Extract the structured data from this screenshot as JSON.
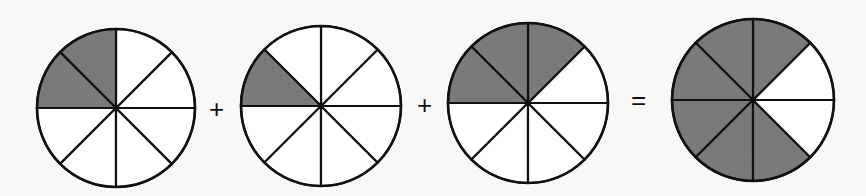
{
  "colors": {
    "shaded": "#7a7a7a",
    "unshaded": "#ffffff",
    "stroke": "#111111",
    "background": "#f8f8f7"
  },
  "equation": {
    "terms": [
      {
        "label": "2/8",
        "divisions": 8,
        "shaded_sectors": [
          2,
          3
        ],
        "cx": 116,
        "cy": 108,
        "r": 79
      },
      {
        "label": "1/8",
        "divisions": 8,
        "shaded_sectors": [
          3
        ],
        "cx": 321,
        "cy": 106,
        "r": 80
      },
      {
        "label": "3/8",
        "divisions": 8,
        "shaded_sectors": [
          1,
          2,
          3
        ],
        "cx": 528,
        "cy": 103,
        "r": 80
      }
    ],
    "result": {
      "label": "6/8",
      "divisions": 8,
      "shaded_sectors": [
        1,
        2,
        3,
        4,
        5,
        6
      ],
      "cx": 753,
      "cy": 100,
      "r": 81
    },
    "operators": [
      {
        "symbol": "+",
        "x": 217,
        "y": 110
      },
      {
        "symbol": "+",
        "x": 425,
        "y": 106
      },
      {
        "symbol": "=",
        "x": 639,
        "y": 101
      }
    ]
  }
}
